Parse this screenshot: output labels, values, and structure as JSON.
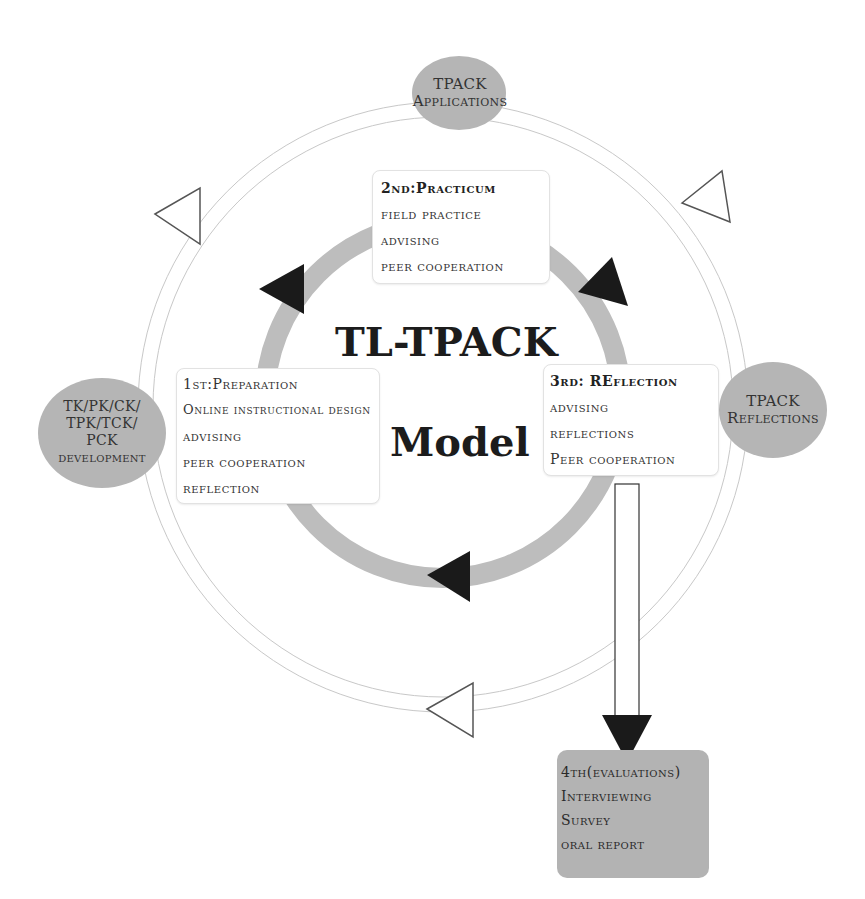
{
  "diagram": {
    "title_line1": "TL-TPACK",
    "title_line2": "Model",
    "outer_nodes": [
      {
        "id": "top",
        "label_line1": "TPACK",
        "label_line2": "Applications"
      },
      {
        "id": "right",
        "label_line1": "TPACK",
        "label_line2": "Reflections"
      },
      {
        "id": "left",
        "label_line1": "TK/PK/CK/",
        "label_line2": "TPK/TCK/",
        "label_line3": "PCK",
        "label_line4": "development"
      }
    ],
    "stages": [
      {
        "id": "preparation",
        "title": "1st:Preparation",
        "items": [
          "Online instructional design",
          "advising",
          "peer cooperation",
          "reflection"
        ]
      },
      {
        "id": "practicum",
        "title": "2nd:Practicum",
        "items": [
          "field practice",
          "advising",
          "peer cooperation"
        ]
      },
      {
        "id": "reflection",
        "title": "3rd: REflection",
        "items": [
          "advising",
          "reflections",
          "Peer cooperation"
        ]
      },
      {
        "id": "evaluations",
        "title": "4th(evaluations)",
        "items": [
          "Interviewing",
          "Survey",
          "oral report"
        ]
      }
    ],
    "colors": {
      "inner_ring": "#bdbdbd",
      "outer_ring": "#c8c8c8",
      "node_fill": "#b5b5b5",
      "arrow_fill": "#1a1a1a",
      "eval_fill": "#b3b3b3"
    }
  }
}
